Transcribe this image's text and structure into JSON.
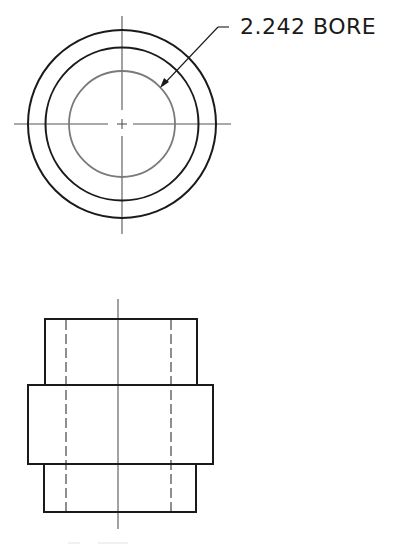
{
  "drawing": {
    "title": "Bushing orthographic views",
    "callout": {
      "label": "2.242 BORE",
      "value": "2.242",
      "feature": "BORE"
    },
    "caption": "",
    "colors": {
      "object_line": "#1a1a1a",
      "bore_line": "#7a7a7a",
      "center_line": "#555555",
      "hidden_line": "#444444",
      "background": "#ffffff"
    },
    "views": [
      {
        "name": "top-view",
        "type": "circular",
        "center": [
          122,
          124
        ],
        "circles": [
          {
            "name": "outer-diameter",
            "r": 94
          },
          {
            "name": "shoulder-diameter",
            "r": 76
          },
          {
            "name": "bore",
            "r": 53
          }
        ]
      },
      {
        "name": "front-view",
        "type": "section-outline",
        "body": {
          "x": 45,
          "y": 319,
          "width": 152,
          "height": 193
        },
        "flange": {
          "x": 28,
          "y": 385,
          "width": 185,
          "height": 79
        },
        "hidden_lines_x": [
          66,
          171
        ],
        "center_line_x": 118
      }
    ]
  }
}
